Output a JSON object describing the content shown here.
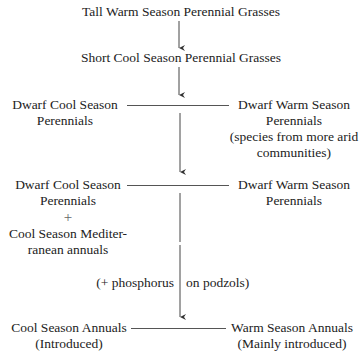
{
  "diagram": {
    "type": "succession-flowchart",
    "nodes": {
      "n1": {
        "label": "Tall Warm Season Perennial Grasses"
      },
      "n2": {
        "label": "Short Cool Season Perennial Grasses"
      },
      "n3_left": {
        "lines": [
          "Dwarf Cool Season",
          "Perennials"
        ]
      },
      "n3_right": {
        "lines": [
          "Dwarf Warm Season",
          "Perennials",
          "(species from more arid",
          "communities)"
        ]
      },
      "n4_left": {
        "lines": [
          "Dwarf Cool Season",
          "Perennials",
          "+",
          "Cool Season Mediter-",
          "ranean annuals"
        ]
      },
      "n4_right": {
        "lines": [
          "Dwarf Warm Season",
          "Perennials"
        ]
      },
      "n5_left": {
        "lines": [
          "Cool Season Annuals",
          "(Introduced)"
        ]
      },
      "n5_right": {
        "lines": [
          "Warm Season Annuals",
          "(Mainly introduced)"
        ]
      }
    },
    "annotation": {
      "left": "(+ phosphorus",
      "right": "on podzols)"
    },
    "edges": [
      {
        "from": "n1",
        "to": "n2",
        "style": "arrow"
      },
      {
        "from": "n2",
        "to": "row3",
        "style": "arrow"
      },
      {
        "from": "n3_left",
        "to": "n3_right",
        "style": "line"
      },
      {
        "from": "row3",
        "to": "row4",
        "style": "arrow"
      },
      {
        "from": "n4_left",
        "to": "n4_right",
        "style": "line"
      },
      {
        "from": "row4",
        "to": "row5",
        "style": "arrow",
        "label": "(+ phosphorus on podzols)"
      },
      {
        "from": "n5_left",
        "to": "n5_right",
        "style": "line"
      }
    ],
    "colors": {
      "ink": "#222222",
      "background": "#ffffff"
    }
  }
}
